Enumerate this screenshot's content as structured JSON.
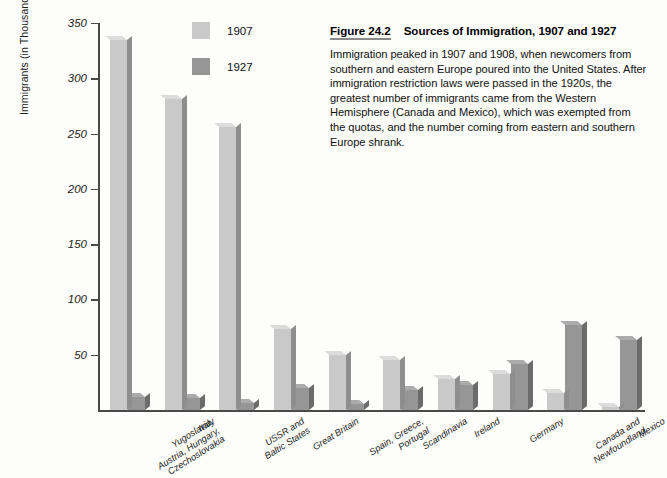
{
  "caption": {
    "figure_number": "Figure 24.2",
    "title": "Sources of Immigration, 1907 and 1927",
    "body": "Immigration peaked in 1907 and 1908, when newcomers from southern and eastern Europe poured into the United States. After immigration restriction laws were passed in the 1920s, the greatest number of immigrants came from the Western Hemisphere (Canada and Mexico), which was exempted from the quotas, and the number coming from eastern and southern Europe shrank.",
    "underline_color": "#8a8a8a"
  },
  "legend": {
    "items": [
      {
        "label": "1907",
        "color": "#c9c9c9"
      },
      {
        "label": "1927",
        "color": "#969696"
      }
    ]
  },
  "axis": {
    "y_title": "Immigrants (in Thousands)",
    "y_ticks": [
      "350",
      "300",
      "250",
      "200",
      "150",
      "100",
      "50"
    ]
  },
  "chart_data": {
    "type": "bar",
    "title": "Sources of Immigration, 1907 and 1927",
    "xlabel": "",
    "ylabel": "Immigrants (in Thousands)",
    "ylim": [
      0,
      350
    ],
    "ytick_values": [
      50,
      100,
      150,
      200,
      250,
      300,
      350
    ],
    "grid": false,
    "legend_position": "top-center-left",
    "categories": [
      "Yugoslavia, Austria, Hungary, Czechoslovakia",
      "Italy",
      "USSR and Baltic States",
      "Great Britain",
      "Spain, Greece, Portugal",
      "Scandinavia",
      "Ireland",
      "Germany",
      "Canada and Newfoundland",
      "Mexico"
    ],
    "category_lines": [
      [
        "Yugoslavia,",
        "Austria, Hungary,",
        "Czechoslovakia"
      ],
      [
        "Italy"
      ],
      [
        "USSR and",
        "Baltic States"
      ],
      [
        "Great Britain"
      ],
      [
        "Spain, Greece,",
        "Portugal"
      ],
      [
        "Scandinavia"
      ],
      [
        "Ireland"
      ],
      [
        "Germany"
      ],
      [
        "Canada and",
        "Newfoundland"
      ],
      [
        "Mexico"
      ]
    ],
    "series": [
      {
        "name": "1907",
        "color": "#c9c9c9",
        "values": [
          335,
          281,
          256,
          73,
          50,
          45,
          28,
          33,
          15,
          3
        ]
      },
      {
        "name": "1927",
        "color": "#969696",
        "values": [
          12,
          11,
          6,
          20,
          5,
          18,
          23,
          42,
          77,
          63
        ]
      }
    ]
  }
}
